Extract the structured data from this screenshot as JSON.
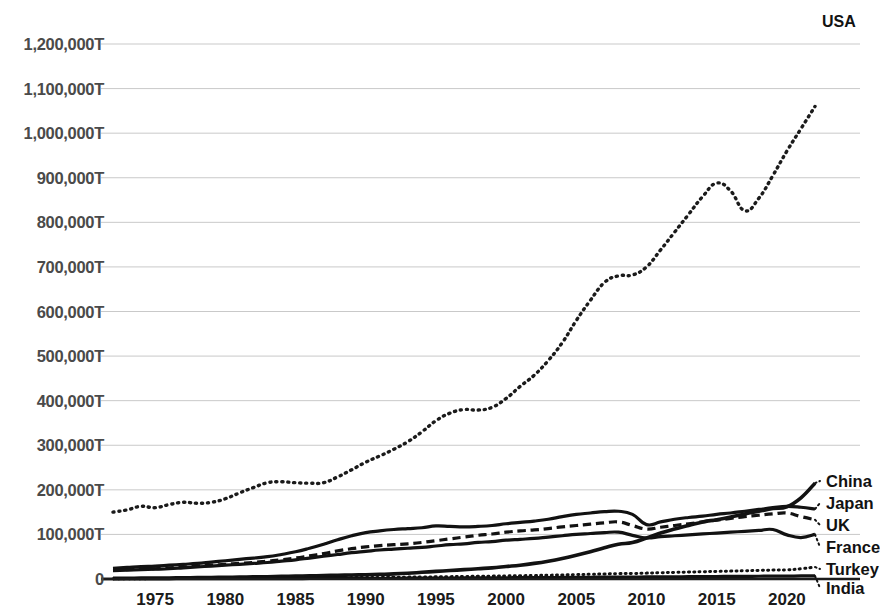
{
  "chart_data": {
    "type": "line",
    "title": "",
    "subtitle": "",
    "xlabel": "",
    "ylabel": "",
    "xlim": [
      1972,
      2022
    ],
    "ylim": [
      0,
      1300000
    ],
    "grid": true,
    "grid_axis": "y",
    "legend_position": "right-end-of-line",
    "y_tick_labels": [
      "1,200,000T",
      "1,100,000T",
      "1,000,000T",
      "900,000T",
      "800,000T",
      "700,000T",
      "600,000T",
      "500,000T",
      "400,000T",
      "300,000T",
      "200,000T",
      "100,000T",
      "0"
    ],
    "y_tick_values": [
      1200000,
      1100000,
      1000000,
      900000,
      800000,
      700000,
      600000,
      500000,
      400000,
      300000,
      200000,
      100000,
      0
    ],
    "x_tick_labels": [
      "1975",
      "1980",
      "1985",
      "1990",
      "1995",
      "2000",
      "2005",
      "2010",
      "2015",
      "2020"
    ],
    "x_tick_values": [
      1975,
      1980,
      1985,
      1990,
      1995,
      2000,
      2005,
      2010,
      2015,
      2020
    ],
    "x": [
      1972,
      1973,
      1974,
      1975,
      1976,
      1977,
      1978,
      1979,
      1980,
      1981,
      1982,
      1983,
      1984,
      1985,
      1986,
      1987,
      1988,
      1989,
      1990,
      1991,
      1992,
      1993,
      1994,
      1995,
      1996,
      1997,
      1998,
      1999,
      2000,
      2001,
      2002,
      2003,
      2004,
      2005,
      2006,
      2007,
      2008,
      2009,
      2010,
      2011,
      2012,
      2013,
      2014,
      2015,
      2016,
      2017,
      2018,
      2019,
      2020,
      2021,
      2022
    ],
    "series": [
      {
        "name": "USA",
        "label": "USA",
        "style": "dotted",
        "color": "#1b1b1b",
        "width": 3.4,
        "values": [
          150000,
          155000,
          163000,
          160000,
          167000,
          172000,
          170000,
          172000,
          180000,
          193000,
          205000,
          216000,
          218000,
          216000,
          215000,
          216000,
          229000,
          245000,
          262000,
          276000,
          291000,
          308000,
          330000,
          355000,
          372000,
          380000,
          379000,
          385000,
          405000,
          432000,
          457000,
          490000,
          530000,
          580000,
          625000,
          665000,
          680000,
          682000,
          700000,
          738000,
          778000,
          818000,
          858000,
          888000,
          870000,
          826000,
          854000,
          905000,
          960000,
          1010000,
          1060000
        ]
      },
      {
        "name": "Japan",
        "label": "Japan",
        "style": "solid",
        "color": "#121212",
        "width": 3.2,
        "values": [
          24000,
          26000,
          28000,
          29000,
          31000,
          33000,
          35000,
          38000,
          41000,
          44000,
          47000,
          50000,
          55000,
          61000,
          69000,
          78000,
          88000,
          97000,
          104000,
          108000,
          111000,
          113000,
          115000,
          119000,
          118000,
          117000,
          118000,
          120000,
          124000,
          127000,
          130000,
          134000,
          140000,
          145000,
          148000,
          151000,
          152000,
          145000,
          122000,
          128000,
          134000,
          138000,
          141000,
          145000,
          148000,
          152000,
          156000,
          160000,
          163000,
          161000,
          157000
        ]
      },
      {
        "name": "UK",
        "label": "UK",
        "style": "dashed",
        "color": "#121212",
        "width": 3.2,
        "values": [
          20000,
          21000,
          22000,
          23000,
          25000,
          27000,
          29000,
          31000,
          33000,
          35000,
          37000,
          40000,
          43000,
          47000,
          52000,
          57000,
          63000,
          68000,
          72000,
          75000,
          77000,
          79000,
          82000,
          86000,
          90000,
          94000,
          98000,
          101000,
          105000,
          108000,
          110000,
          113000,
          117000,
          120000,
          123000,
          126000,
          128000,
          120000,
          112000,
          116000,
          120000,
          124000,
          128000,
          132000,
          136000,
          140000,
          143000,
          146000,
          148000,
          140000,
          133000
        ]
      },
      {
        "name": "France",
        "label": "France",
        "style": "solid",
        "color": "#121212",
        "width": 3.2,
        "values": [
          19000,
          20000,
          21000,
          22000,
          23000,
          25000,
          27000,
          29000,
          31000,
          33000,
          35000,
          37000,
          40000,
          43000,
          47000,
          51000,
          55000,
          59000,
          62000,
          65000,
          67000,
          69000,
          71000,
          74000,
          77000,
          79000,
          82000,
          84000,
          87000,
          89000,
          91000,
          94000,
          97000,
          100000,
          102000,
          104000,
          105000,
          98000,
          92000,
          95000,
          97000,
          99000,
          101000,
          103000,
          105000,
          107000,
          109000,
          111000,
          99000,
          93000,
          100000
        ]
      },
      {
        "name": "China",
        "label": "China",
        "style": "solid",
        "color": "#121212",
        "width": 3.6,
        "values": [
          1500,
          1700,
          1900,
          2100,
          2300,
          2600,
          3000,
          3400,
          3800,
          4200,
          4700,
          5200,
          5800,
          6400,
          7000,
          7700,
          8400,
          9000,
          9600,
          10500,
          11500,
          13000,
          15000,
          17000,
          19000,
          21000,
          23000,
          25000,
          28000,
          31000,
          35000,
          40000,
          46000,
          53000,
          61000,
          70000,
          78000,
          82000,
          92000,
          103000,
          112000,
          120000,
          128000,
          133000,
          139000,
          146000,
          152000,
          158000,
          162000,
          182000,
          215000
        ]
      },
      {
        "name": "Turkey",
        "label": "Turkey",
        "style": "dotted",
        "color": "#121212",
        "width": 3.0,
        "values": [
          600,
          700,
          800,
          900,
          1000,
          1100,
          1200,
          1300,
          1400,
          1500,
          1700,
          1900,
          2100,
          2300,
          2500,
          2700,
          2900,
          3100,
          3400,
          3600,
          3900,
          4200,
          4500,
          4900,
          5300,
          5700,
          6100,
          6500,
          7000,
          7400,
          7900,
          8500,
          9200,
          9900,
          10600,
          11300,
          12000,
          12400,
          13200,
          14000,
          14800,
          15600,
          16400,
          17000,
          17700,
          18500,
          19300,
          20000,
          20600,
          23000,
          27000
        ]
      },
      {
        "name": "India",
        "label": "India",
        "style": "solid",
        "color": "#121212",
        "width": 3.2,
        "values": [
          300,
          350,
          400,
          450,
          500,
          550,
          600,
          650,
          700,
          760,
          820,
          880,
          950,
          1020,
          1100,
          1180,
          1260,
          1350,
          1450,
          1550,
          1650,
          1780,
          1900,
          2050,
          2200,
          2350,
          2500,
          2650,
          2800,
          2950,
          3100,
          3300,
          3500,
          3700,
          3900,
          4100,
          4300,
          4400,
          4600,
          4800,
          5000,
          5200,
          5400,
          5600,
          5800,
          6000,
          6200,
          6400,
          6500,
          6800,
          7200
        ]
      }
    ],
    "colors": {
      "axis": "#1b1b1b",
      "grid": "#c9c9c9",
      "ytick_text": "#4a4a4a",
      "xtick_text": "#1b1b1b",
      "series_label": "#121212",
      "background": "#ffffff"
    }
  }
}
